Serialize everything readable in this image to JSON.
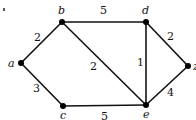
{
  "graph": {
    "vertices": [
      {
        "id": "a",
        "label": "a",
        "x": 21,
        "y": 63
      },
      {
        "id": "b",
        "label": "b",
        "x": 62,
        "y": 22
      },
      {
        "id": "c",
        "label": "c",
        "x": 63,
        "y": 106
      },
      {
        "id": "d",
        "label": "d",
        "x": 146,
        "y": 22
      },
      {
        "id": "e",
        "label": "e",
        "x": 146,
        "y": 105
      },
      {
        "id": "z",
        "label": "z",
        "x": 188,
        "y": 66
      }
    ],
    "edges": [
      {
        "from": "a",
        "to": "b",
        "weight": "2"
      },
      {
        "from": "a",
        "to": "c",
        "weight": "3"
      },
      {
        "from": "b",
        "to": "d",
        "weight": "5"
      },
      {
        "from": "b",
        "to": "e",
        "weight": "2"
      },
      {
        "from": "d",
        "to": "e",
        "weight": "1"
      },
      {
        "from": "d",
        "to": "z",
        "weight": "2"
      },
      {
        "from": "e",
        "to": "z",
        "weight": "4"
      },
      {
        "from": "c",
        "to": "e",
        "weight": "5"
      }
    ]
  },
  "colors": {
    "edge": "#111111",
    "vertex": "#000000",
    "background": "#ffffff"
  }
}
